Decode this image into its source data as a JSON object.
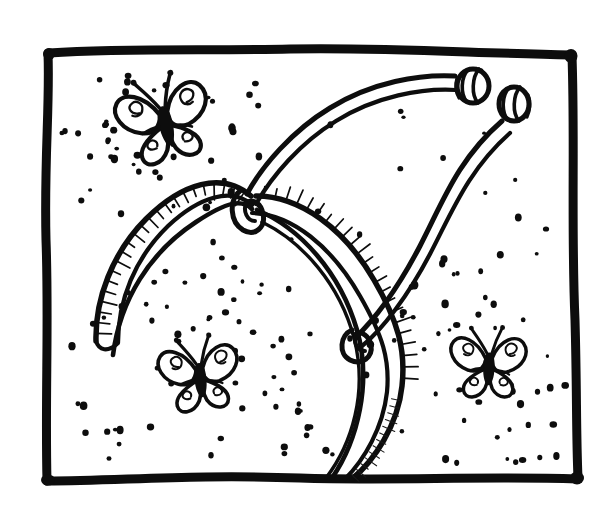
{
  "canvas": {
    "width": 612,
    "height": 513,
    "background_color": "#ffffff",
    "ink_color": "#0d0d0d",
    "style": "hand-drawn black ink line art, coloring-book page",
    "title": "Butterfly antenna headband with sparkles inside a hand-drawn frame",
    "alt_text": "Black and white line drawing: a hand-drawn rectangular border frames a curved hair headband fitted with two bendy antennae ending in round beads, surrounded by three small butterflies and scattered dots of sparkle."
  },
  "frame": {
    "name": "hand-drawn-border",
    "color": "#0d0d0d",
    "stroke_width": 9,
    "corners": {
      "top_left": [
        48,
        52
      ],
      "top_right": [
        572,
        55
      ],
      "bottom_right": [
        578,
        478
      ],
      "bottom_left": [
        46,
        481
      ]
    }
  },
  "headband": {
    "label": "antenna headband",
    "band_color": "#0d0d0d",
    "band_stroke_width": 5,
    "hatch_count": 34,
    "left_tip": [
      95,
      340
    ],
    "apex": [
      250,
      205
    ],
    "right_tip": [
      345,
      480
    ],
    "knots": [
      {
        "name": "left-knot",
        "cx": 251,
        "cy": 222,
        "r": 13
      },
      {
        "name": "right-knot",
        "cx": 360,
        "cy": 345,
        "r": 12
      }
    ]
  },
  "antennae": [
    {
      "name": "left-antenna",
      "from": [
        250,
        210
      ],
      "to": [
        466,
        84
      ],
      "bead": {
        "cx": 474,
        "cy": 90,
        "rx": 15,
        "ry": 17,
        "rings": 3
      }
    },
    {
      "name": "right-antenna",
      "from": [
        357,
        342
      ],
      "to": [
        512,
        110
      ],
      "bead": {
        "cx": 515,
        "cy": 103,
        "rx": 15,
        "ry": 17,
        "rings": 3
      }
    }
  ],
  "butterflies": [
    {
      "name": "butterfly-top-left",
      "position": [
        165,
        120
      ],
      "scale": 1.0,
      "rotation": -12,
      "wings": 4,
      "antennae": 2,
      "wing_pattern": "spiral"
    },
    {
      "name": "butterfly-bottom-left",
      "position": [
        200,
        375
      ],
      "scale": 0.86,
      "rotation": -6,
      "wings": 4,
      "antennae": 2,
      "wing_pattern": "spiral"
    },
    {
      "name": "butterfly-right",
      "position": [
        489,
        364
      ],
      "scale": 0.82,
      "rotation": 2,
      "wings": 4,
      "antennae": 2,
      "wing_pattern": "spiral"
    }
  ],
  "sparkles": {
    "name": "sparkle-dots",
    "color": "#0d0d0d",
    "count": 196,
    "description": "scattered round ink dots, densest around each butterfly"
  },
  "legend": {
    "subject": "headband with springy butterfly antennae",
    "motifs": [
      "butterfly",
      "sparkle dots",
      "headband",
      "bead tips",
      "hand-drawn frame"
    ]
  }
}
